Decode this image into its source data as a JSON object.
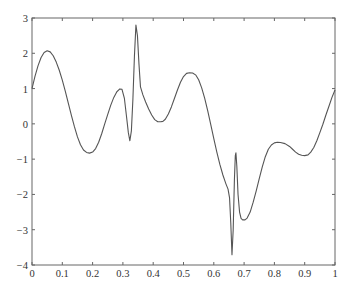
{
  "chart_data": {
    "type": "line",
    "title": "",
    "xlabel": "",
    "ylabel": "",
    "xlim": [
      0,
      1
    ],
    "ylim": [
      -4,
      3
    ],
    "grid": false,
    "legend": null,
    "xticks": [
      0,
      0.1,
      0.2,
      0.3,
      0.4,
      0.5,
      0.6,
      0.7,
      0.8,
      0.9,
      1
    ],
    "xtick_labels": [
      "0",
      "0.1",
      "0.2",
      "0.3",
      "0.4",
      "0.5",
      "0.6",
      "0.7",
      "0.8",
      "0.9",
      "1"
    ],
    "yticks": [
      3,
      2,
      1,
      0,
      -1,
      -2,
      -3,
      -4
    ],
    "ytick_labels": [
      "3",
      "2",
      "1",
      "0",
      "−1",
      "−2",
      "−3",
      "−4"
    ],
    "line_color": "#555555",
    "series": [
      {
        "name": "f(x)",
        "x": [
          0,
          0.01,
          0.02,
          0.03,
          0.04,
          0.05,
          0.06,
          0.07,
          0.08,
          0.09,
          0.1,
          0.11,
          0.12,
          0.13,
          0.14,
          0.15,
          0.16,
          0.17,
          0.18,
          0.19,
          0.2,
          0.21,
          0.22,
          0.23,
          0.24,
          0.25,
          0.26,
          0.27,
          0.28,
          0.29,
          0.297,
          0.305,
          0.312,
          0.318,
          0.323,
          0.328,
          0.333,
          0.338,
          0.343,
          0.348,
          0.353,
          0.358,
          0.366,
          0.375,
          0.385,
          0.395,
          0.405,
          0.415,
          0.425,
          0.432,
          0.44,
          0.45,
          0.46,
          0.47,
          0.48,
          0.49,
          0.5,
          0.51,
          0.52,
          0.53,
          0.541,
          0.55,
          0.56,
          0.57,
          0.58,
          0.59,
          0.6,
          0.61,
          0.62,
          0.63,
          0.64,
          0.647,
          0.652,
          0.656,
          0.66,
          0.664,
          0.668,
          0.671,
          0.673,
          0.676,
          0.68,
          0.685,
          0.69,
          0.695,
          0.703,
          0.71,
          0.72,
          0.73,
          0.74,
          0.75,
          0.76,
          0.77,
          0.78,
          0.79,
          0.8,
          0.81,
          0.82,
          0.835,
          0.85,
          0.86,
          0.87,
          0.88,
          0.89,
          0.9,
          0.911,
          0.92,
          0.93,
          0.94,
          0.95,
          0.96,
          0.97,
          0.98,
          0.99,
          1.0
        ],
        "y": [
          1.0,
          1.35,
          1.65,
          1.88,
          2.02,
          2.07,
          2.04,
          1.93,
          1.75,
          1.52,
          1.24,
          0.92,
          0.58,
          0.24,
          -0.08,
          -0.37,
          -0.59,
          -0.74,
          -0.81,
          -0.83,
          -0.8,
          -0.7,
          -0.52,
          -0.28,
          0.0,
          0.27,
          0.53,
          0.75,
          0.91,
          0.99,
          0.98,
          0.72,
          0.2,
          -0.25,
          -0.48,
          -0.2,
          0.7,
          1.9,
          2.8,
          2.5,
          1.7,
          1.05,
          0.82,
          0.62,
          0.42,
          0.25,
          0.12,
          0.06,
          0.06,
          0.07,
          0.13,
          0.28,
          0.48,
          0.72,
          0.96,
          1.18,
          1.34,
          1.43,
          1.45,
          1.44,
          1.38,
          1.25,
          1.02,
          0.72,
          0.37,
          -0.02,
          -0.42,
          -0.8,
          -1.15,
          -1.45,
          -1.7,
          -1.85,
          -2.1,
          -2.8,
          -3.71,
          -3.0,
          -1.6,
          -0.9,
          -0.82,
          -1.2,
          -2.0,
          -2.5,
          -2.68,
          -2.72,
          -2.72,
          -2.67,
          -2.5,
          -2.22,
          -1.9,
          -1.55,
          -1.22,
          -0.93,
          -0.72,
          -0.6,
          -0.54,
          -0.52,
          -0.53,
          -0.56,
          -0.64,
          -0.72,
          -0.8,
          -0.86,
          -0.89,
          -0.9,
          -0.88,
          -0.8,
          -0.67,
          -0.48,
          -0.25,
          -0.01,
          0.25,
          0.5,
          0.75,
          0.96
        ]
      }
    ]
  },
  "layout": {
    "plot_left": 32,
    "plot_top": 18,
    "plot_right": 335,
    "plot_bottom": 265
  }
}
